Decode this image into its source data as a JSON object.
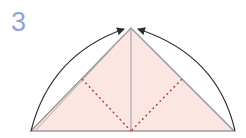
{
  "step": {
    "number": "3"
  },
  "colors": {
    "step_number": "#8fa3d6",
    "paper_fill": "#fce6e3",
    "edge": "#9a9a9a",
    "valley_fold": "#b5473c",
    "arrow": "#2f2f2f"
  },
  "diagram": {
    "shape": "triangle",
    "vertices": {
      "left": [
        31,
        131
      ],
      "right": [
        234,
        131
      ],
      "apex": [
        131,
        28
      ]
    },
    "center_line": true,
    "valley_folds": [
      {
        "from": [
          82,
          79
        ],
        "to": [
          131,
          131
        ]
      },
      {
        "from": [
          182,
          79
        ],
        "to": [
          131,
          131
        ]
      }
    ],
    "arrows": [
      {
        "name": "left-corner-fold-arrow",
        "from": [
          31,
          131
        ],
        "to": [
          124,
          29
        ]
      },
      {
        "name": "right-corner-fold-arrow",
        "from": [
          235,
          131
        ],
        "to": [
          138,
          29
        ]
      }
    ]
  }
}
